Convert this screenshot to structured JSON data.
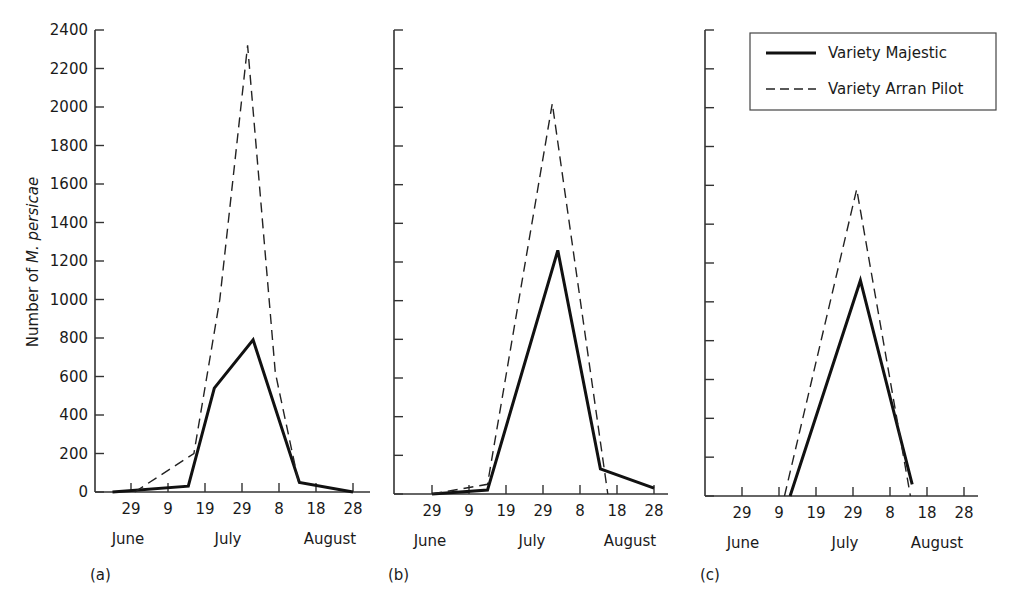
{
  "chart_data": [
    {
      "panel": "(a)",
      "type": "line",
      "ylabel": "Number of M. persicae",
      "ylim": [
        0,
        2400
      ],
      "yticks": [
        0,
        200,
        400,
        600,
        800,
        1000,
        1200,
        1400,
        1600,
        1800,
        2000,
        2200,
        2400
      ],
      "ytick_labels_shown": true,
      "x_unit": "days since 29 June",
      "xticks": [
        0,
        10,
        20,
        30,
        40,
        50,
        60
      ],
      "xtick_labels": [
        "29",
        "9",
        "19",
        "29",
        "8",
        "18",
        "28"
      ],
      "month_labels": [
        "June",
        "July",
        "August"
      ],
      "grid": false,
      "series": [
        {
          "name": "Variety Majestic",
          "style": "solid",
          "x": [
            -5,
            15.5,
            22.5,
            33,
            45.5,
            60
          ],
          "values": [
            0,
            30,
            540,
            790,
            50,
            0
          ]
        },
        {
          "name": "Variety Arran Pilot",
          "style": "dashed",
          "x": [
            1,
            17,
            24,
            31.5,
            39,
            45.5
          ],
          "values": [
            0,
            200,
            1000,
            2320,
            620,
            30
          ]
        }
      ]
    },
    {
      "panel": "(b)",
      "type": "line",
      "ylim": [
        0,
        2400
      ],
      "yticks": [
        0,
        200,
        400,
        600,
        800,
        1000,
        1200,
        1400,
        1600,
        1800,
        2000,
        2200,
        2400
      ],
      "ytick_labels_shown": false,
      "xticks": [
        0,
        10,
        20,
        30,
        40,
        50,
        60
      ],
      "xtick_labels": [
        "29",
        "9",
        "19",
        "29",
        "8",
        "18",
        "28"
      ],
      "month_labels": [
        "June",
        "July",
        "August"
      ],
      "grid": false,
      "series": [
        {
          "name": "Variety Majestic",
          "style": "solid",
          "x": [
            0,
            15,
            34,
            45.5,
            60
          ],
          "values": [
            0,
            20,
            1260,
            130,
            30
          ]
        },
        {
          "name": "Variety Arran Pilot",
          "style": "dashed",
          "x": [
            0,
            15,
            32.5,
            47.5
          ],
          "values": [
            0,
            50,
            2020,
            0
          ]
        }
      ]
    },
    {
      "panel": "(c)",
      "type": "line",
      "ylim": [
        0,
        2400
      ],
      "yticks": [
        0,
        200,
        400,
        600,
        800,
        1000,
        1200,
        1400,
        1600,
        1800,
        2000,
        2200,
        2400
      ],
      "ytick_labels_shown": false,
      "xticks": [
        0,
        10,
        20,
        30,
        40,
        50,
        60
      ],
      "xtick_labels": [
        "29",
        "9",
        "19",
        "29",
        "8",
        "18",
        "28"
      ],
      "month_labels": [
        "June",
        "July",
        "August"
      ],
      "grid": false,
      "legend": {
        "position": "upper-right",
        "entries": [
          {
            "label": "Variety Majestic",
            "style": "solid"
          },
          {
            "label": "Variety Arran Pilot",
            "style": "dashed"
          }
        ]
      },
      "series": [
        {
          "name": "Variety Majestic",
          "style": "solid",
          "x": [
            13,
            32,
            46
          ],
          "values": [
            0,
            1110,
            60
          ]
        },
        {
          "name": "Variety Arran Pilot",
          "style": "dashed",
          "x": [
            11.5,
            31,
            45.5
          ],
          "values": [
            0,
            1580,
            0
          ]
        }
      ]
    }
  ],
  "labels": {
    "ylabel_prefix": "Number of ",
    "ylabel_italic": "M. persicae",
    "legend_majestic": "Variety Majestic",
    "legend_arran": "Variety Arran Pilot",
    "panel_a": "(a)",
    "panel_b": "(b)",
    "panel_c": "(c)"
  },
  "layout": {
    "panels": [
      {
        "axis_x": 95,
        "origin_x": 131,
        "baseline_y": 492,
        "right_x": 370,
        "month_x": [
          128,
          228,
          330
        ]
      },
      {
        "axis_x": 394,
        "origin_x": 432,
        "baseline_y": 494,
        "right_x": 668,
        "month_x": [
          430,
          532,
          630
        ]
      },
      {
        "axis_x": 705,
        "origin_x": 742,
        "baseline_y": 496,
        "right_x": 978,
        "month_x": [
          743,
          845,
          937
        ]
      }
    ],
    "top_y": 30,
    "px_per_day": 3.7
  }
}
